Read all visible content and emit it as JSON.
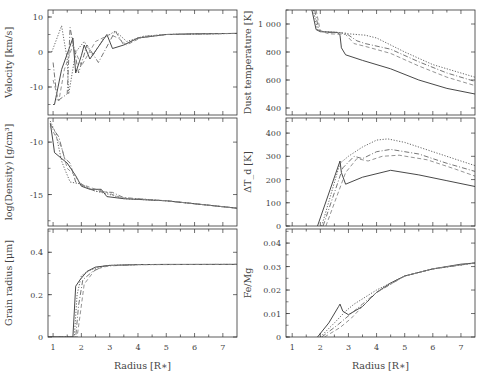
{
  "figure": {
    "width": 484,
    "height": 379,
    "line_styles": [
      "solid",
      "dotted",
      "dash-dot",
      "dashed",
      "long-dash"
    ],
    "line_colors": [
      "#333333",
      "#555555",
      "#666666",
      "#888888",
      "#aaaaaa"
    ]
  },
  "chart_data": [
    {
      "type": "line",
      "panel": "top-left",
      "title": "",
      "xlabel": "",
      "ylabel": "Velocity [km/s]",
      "xlim": [
        0.82,
        7.5
      ],
      "ylim": [
        -18,
        12
      ],
      "xticks": [
        1,
        2,
        3,
        4,
        5,
        6,
        7
      ],
      "yticks": [
        10,
        0,
        -10
      ],
      "ytick_labels": [
        "10",
        "0",
        "-10"
      ],
      "grid": false,
      "series": [
        {
          "name": "model-1",
          "style": "solid",
          "x": [
            1.0,
            1.05,
            1.1,
            1.3,
            1.7,
            1.8,
            2.0,
            2.1,
            2.3,
            2.9,
            3.1,
            3.5,
            4.0,
            5.0,
            6.0,
            7.5
          ],
          "y": [
            -15,
            -15,
            -13,
            -5,
            4,
            -6,
            -1,
            2,
            -2,
            5,
            1,
            2,
            4,
            5,
            5.2,
            5.3
          ]
        },
        {
          "name": "model-2",
          "style": "dotted",
          "x": [
            0.95,
            1.0,
            1.3,
            1.5,
            1.55,
            1.8,
            2.1,
            2.4,
            2.8,
            3.2,
            3.6,
            4.2,
            5.0,
            7.5
          ],
          "y": [
            0,
            1,
            7.5,
            -2,
            -12,
            0,
            3,
            -1,
            4,
            6,
            3,
            4.5,
            5,
            5.3
          ]
        },
        {
          "name": "model-3",
          "style": "dash-dot",
          "x": [
            1.0,
            1.15,
            1.5,
            1.6,
            1.9,
            2.2,
            2.6,
            3.2,
            3.5,
            4.0,
            5.0,
            7.5
          ],
          "y": [
            -3,
            -14,
            -12,
            7,
            -6,
            2,
            -3,
            6,
            2,
            4,
            5,
            5.3
          ]
        },
        {
          "name": "model-4",
          "style": "dashed",
          "x": [
            1.0,
            1.2,
            1.4,
            1.7,
            2.0,
            2.5,
            3.0,
            3.3,
            3.6,
            4.2,
            5.0,
            7.5
          ],
          "y": [
            -8,
            -14,
            -5,
            2,
            -4,
            3,
            5,
            4,
            2,
            4.5,
            5,
            5.3
          ]
        }
      ]
    },
    {
      "type": "line",
      "panel": "middle-left",
      "title": "",
      "xlabel": "",
      "ylabel": "log(Density) [g/cm³]",
      "xlim": [
        0.82,
        7.5
      ],
      "ylim": [
        -18,
        -7.7
      ],
      "xticks": [
        1,
        2,
        3,
        4,
        5,
        6,
        7
      ],
      "yticks": [
        -10,
        -15
      ],
      "ytick_labels": [
        "-10",
        "-15"
      ],
      "grid": false,
      "series": [
        {
          "name": "model-1",
          "style": "solid",
          "x": [
            0.9,
            1.0,
            1.05,
            1.5,
            1.8,
            2.0,
            2.3,
            2.7,
            2.9,
            3.5,
            5.0,
            7.5
          ],
          "y": [
            -8.2,
            -10.0,
            -11.0,
            -12.0,
            -13.2,
            -14.2,
            -14.5,
            -14.5,
            -15.2,
            -15.4,
            -15.6,
            -16.3
          ]
        },
        {
          "name": "model-2",
          "style": "dotted",
          "x": [
            0.9,
            1.1,
            1.3,
            1.4,
            1.6,
            2.0,
            2.4,
            3.0,
            3.5,
            5.0,
            7.5
          ],
          "y": [
            -8.0,
            -9.2,
            -11.8,
            -12.5,
            -13.8,
            -14.0,
            -14.6,
            -15.0,
            -15.4,
            -15.6,
            -16.3
          ]
        },
        {
          "name": "model-3",
          "style": "dash-dot",
          "x": [
            0.9,
            1.2,
            1.4,
            1.6,
            1.8,
            2.1,
            2.5,
            3.1,
            3.5,
            5.0,
            7.5
          ],
          "y": [
            -8.3,
            -9.5,
            -11.5,
            -12.0,
            -13.8,
            -14.2,
            -14.7,
            -14.8,
            -15.3,
            -15.6,
            -16.3
          ]
        },
        {
          "name": "model-4",
          "style": "dashed",
          "x": [
            0.9,
            1.3,
            1.5,
            1.7,
            2.0,
            2.4,
            2.9,
            3.4,
            5.0,
            7.5
          ],
          "y": [
            -8.5,
            -10.5,
            -12.5,
            -13.0,
            -14.0,
            -14.4,
            -14.8,
            -15.3,
            -15.6,
            -16.3
          ]
        }
      ]
    },
    {
      "type": "line",
      "panel": "bottom-left",
      "title": "",
      "xlabel": "Radius [R∗]",
      "ylabel": "Grain radius [μm]",
      "xlim": [
        0.82,
        7.5
      ],
      "ylim": [
        0,
        0.51
      ],
      "xticks": [
        1,
        2,
        3,
        4,
        5,
        6,
        7
      ],
      "xtick_labels": [
        "1",
        "2",
        "3",
        "4",
        "5",
        "6",
        "7"
      ],
      "yticks": [
        0,
        0.2,
        0.4
      ],
      "ytick_labels": [
        "0",
        "0.2",
        "0.4"
      ],
      "grid": false,
      "series": [
        {
          "name": "model-1",
          "style": "solid",
          "x": [
            0.82,
            1.7,
            1.8,
            1.95,
            2.2,
            2.5,
            3.0,
            4.0,
            5.0,
            7.5
          ],
          "y": [
            0,
            0,
            0.24,
            0.27,
            0.31,
            0.33,
            0.338,
            0.342,
            0.343,
            0.343
          ]
        },
        {
          "name": "model-2",
          "style": "dotted",
          "x": [
            0.82,
            1.75,
            1.85,
            2.0,
            2.3,
            2.6,
            3.0,
            4.0,
            7.5
          ],
          "y": [
            0,
            0,
            0.2,
            0.29,
            0.315,
            0.33,
            0.338,
            0.342,
            0.343
          ]
        },
        {
          "name": "model-3",
          "style": "dash-dot",
          "x": [
            0.82,
            1.8,
            1.9,
            2.05,
            2.4,
            2.8,
            4.0,
            7.5
          ],
          "y": [
            0,
            0,
            0.15,
            0.27,
            0.31,
            0.335,
            0.342,
            0.343
          ]
        },
        {
          "name": "model-4",
          "style": "dashed",
          "x": [
            0.82,
            1.85,
            1.95,
            2.1,
            2.5,
            3.0,
            4.0,
            7.5
          ],
          "y": [
            0,
            0,
            0.1,
            0.25,
            0.32,
            0.337,
            0.342,
            0.343
          ]
        }
      ]
    },
    {
      "type": "line",
      "panel": "top-right",
      "title": "",
      "xlabel": "",
      "ylabel": "Dust temperature [K]",
      "xlim": [
        0.78,
        7.5
      ],
      "ylim": [
        350,
        1100
      ],
      "xticks": [
        1,
        2,
        3,
        4,
        5,
        6,
        7
      ],
      "yticks": [
        1000,
        800,
        600,
        400
      ],
      "ytick_labels": [
        "1 000",
        "800",
        "600",
        "400"
      ],
      "grid": false,
      "series": [
        {
          "name": "model-1",
          "style": "solid",
          "x": [
            1.7,
            1.85,
            2.0,
            2.6,
            2.7,
            2.75,
            2.9,
            3.5,
            4.5,
            5.5,
            6.5,
            7.5
          ],
          "y": [
            1100,
            960,
            945,
            940,
            920,
            830,
            780,
            740,
            680,
            600,
            540,
            500
          ]
        },
        {
          "name": "model-2",
          "style": "dotted",
          "x": [
            1.75,
            1.9,
            2.1,
            2.6,
            3.0,
            3.6,
            4.0,
            5.0,
            6.0,
            7.0,
            7.5
          ],
          "y": [
            1100,
            960,
            945,
            940,
            930,
            920,
            900,
            800,
            710,
            650,
            620
          ]
        },
        {
          "name": "model-3",
          "style": "dash-dot",
          "x": [
            1.8,
            1.95,
            2.2,
            2.9,
            3.3,
            3.6,
            4.5,
            5.5,
            6.5,
            7.5
          ],
          "y": [
            1100,
            955,
            940,
            935,
            880,
            860,
            820,
            730,
            650,
            590
          ]
        },
        {
          "name": "model-4",
          "style": "dashed",
          "x": [
            1.85,
            2.0,
            2.3,
            2.9,
            3.2,
            3.6,
            4.5,
            5.5,
            6.5,
            7.5
          ],
          "y": [
            1100,
            950,
            930,
            925,
            860,
            840,
            790,
            700,
            620,
            560
          ]
        }
      ]
    },
    {
      "type": "line",
      "panel": "middle-right",
      "title": "",
      "xlabel": "",
      "ylabel": "ΔT_d [K]",
      "xlim": [
        0.78,
        7.5
      ],
      "ylim": [
        0,
        465
      ],
      "xticks": [
        1,
        2,
        3,
        4,
        5,
        6,
        7
      ],
      "yticks": [
        0,
        100,
        200,
        300,
        400
      ],
      "ytick_labels": [
        "0",
        "100",
        "200",
        "300",
        "400"
      ],
      "grid": false,
      "series": [
        {
          "name": "model-1",
          "style": "solid",
          "x": [
            1.9,
            2.7,
            2.75,
            2.9,
            3.5,
            4.5,
            5.5,
            6.5,
            7.5
          ],
          "y": [
            0,
            280,
            230,
            180,
            210,
            240,
            220,
            195,
            170
          ]
        },
        {
          "name": "model-2",
          "style": "dotted",
          "x": [
            2.05,
            2.7,
            3.0,
            3.5,
            4.0,
            4.4,
            5.0,
            6.0,
            7.0,
            7.5
          ],
          "y": [
            0,
            270,
            300,
            340,
            370,
            375,
            360,
            320,
            280,
            260
          ]
        },
        {
          "name": "model-3",
          "style": "dash-dot",
          "x": [
            2.1,
            2.8,
            3.2,
            3.5,
            4.0,
            4.5,
            5.5,
            6.5,
            7.5
          ],
          "y": [
            0,
            250,
            300,
            290,
            320,
            330,
            310,
            270,
            235
          ]
        },
        {
          "name": "model-4",
          "style": "dashed",
          "x": [
            2.2,
            2.9,
            3.3,
            3.7,
            4.2,
            4.8,
            5.8,
            6.8,
            7.5
          ],
          "y": [
            0,
            230,
            290,
            280,
            300,
            305,
            285,
            245,
            215
          ]
        }
      ]
    },
    {
      "type": "line",
      "panel": "bottom-right",
      "title": "",
      "xlabel": "Radius [R∗]",
      "ylabel": "Fe/Mg",
      "xlim": [
        0.78,
        7.5
      ],
      "ylim": [
        0,
        0.046
      ],
      "xticks": [
        1,
        2,
        3,
        4,
        5,
        6,
        7
      ],
      "xtick_labels": [
        "1",
        "2",
        "3",
        "4",
        "5",
        "6",
        "7"
      ],
      "yticks": [
        0,
        0.01,
        0.02,
        0.03,
        0.04
      ],
      "ytick_labels": [
        "0",
        "0.01",
        "0.02",
        "0.03",
        "0.04"
      ],
      "grid": false,
      "series": [
        {
          "name": "model-1",
          "style": "solid",
          "x": [
            1.9,
            2.3,
            2.65,
            2.7,
            2.8,
            3.0,
            3.5,
            4.0,
            4.5,
            5.0,
            6.0,
            7.0,
            7.5
          ],
          "y": [
            0,
            0.006,
            0.013,
            0.014,
            0.011,
            0.0095,
            0.013,
            0.019,
            0.023,
            0.026,
            0.029,
            0.031,
            0.0315
          ]
        },
        {
          "name": "model-2",
          "style": "dotted",
          "x": [
            2.0,
            2.5,
            2.9,
            3.2,
            3.6,
            4.0,
            5.0,
            6.0,
            7.5
          ],
          "y": [
            0,
            0.006,
            0.011,
            0.014,
            0.017,
            0.02,
            0.026,
            0.029,
            0.0315
          ]
        },
        {
          "name": "model-3",
          "style": "dash-dot",
          "x": [
            2.05,
            2.6,
            3.0,
            3.5,
            4.0,
            5.0,
            6.0,
            7.5
          ],
          "y": [
            0,
            0.005,
            0.009,
            0.014,
            0.019,
            0.026,
            0.029,
            0.0315
          ]
        },
        {
          "name": "model-4",
          "style": "dashed",
          "x": [
            2.15,
            2.7,
            3.1,
            3.5,
            4.0,
            5.0,
            6.0,
            7.5
          ],
          "y": [
            0,
            0.004,
            0.008,
            0.013,
            0.019,
            0.026,
            0.029,
            0.0315
          ]
        }
      ]
    }
  ],
  "panels_layout": [
    {
      "px": [
        48,
        237
      ],
      "py": [
        10,
        115
      ]
    },
    {
      "px": [
        48,
        237
      ],
      "py": [
        118,
        226
      ]
    },
    {
      "px": [
        48,
        237
      ],
      "py": [
        229,
        337
      ]
    },
    {
      "px": [
        286,
        475
      ],
      "py": [
        10,
        115
      ]
    },
    {
      "px": [
        286,
        475
      ],
      "py": [
        118,
        226
      ]
    },
    {
      "px": [
        286,
        475
      ],
      "py": [
        229,
        337
      ]
    }
  ]
}
